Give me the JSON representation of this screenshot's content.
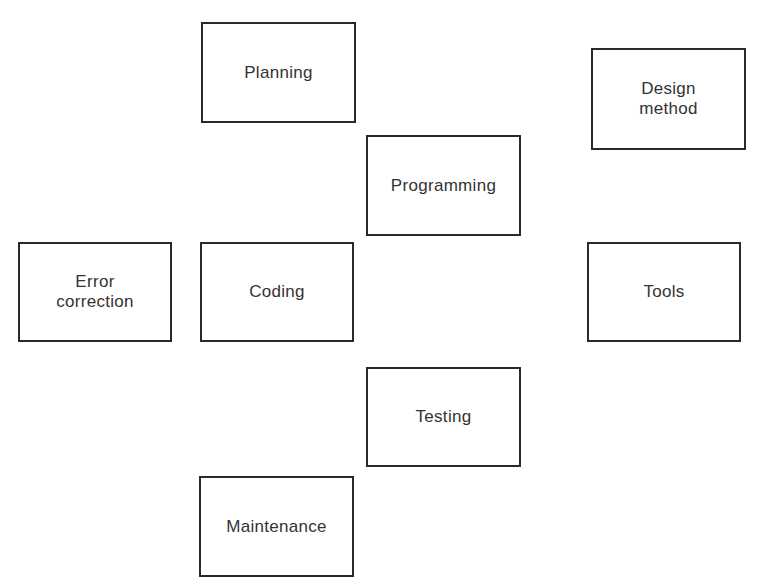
{
  "diagram": {
    "boxes": [
      {
        "id": "planning",
        "label": "Planning",
        "x": 201,
        "y": 22,
        "w": 155,
        "h": 101
      },
      {
        "id": "design-method",
        "label": "Design\nmethod",
        "x": 591,
        "y": 48,
        "w": 155,
        "h": 102
      },
      {
        "id": "programming",
        "label": "Programming",
        "x": 366,
        "y": 135,
        "w": 155,
        "h": 101
      },
      {
        "id": "error-correction",
        "label": "Error\ncorrection",
        "x": 18,
        "y": 242,
        "w": 154,
        "h": 100
      },
      {
        "id": "coding",
        "label": "Coding",
        "x": 200,
        "y": 242,
        "w": 154,
        "h": 100
      },
      {
        "id": "tools",
        "label": "Tools",
        "x": 587,
        "y": 242,
        "w": 154,
        "h": 100
      },
      {
        "id": "testing",
        "label": "Testing",
        "x": 366,
        "y": 367,
        "w": 155,
        "h": 100
      },
      {
        "id": "maintenance",
        "label": "Maintenance",
        "x": 199,
        "y": 476,
        "w": 155,
        "h": 101
      }
    ]
  }
}
